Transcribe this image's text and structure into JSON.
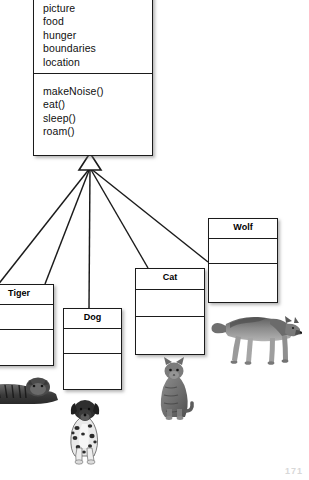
{
  "diagram": {
    "kind": "uml-class-inheritance",
    "superclass": {
      "name": "Animal",
      "attributes": [
        "picture",
        "food",
        "hunger",
        "boundaries",
        "location"
      ],
      "methods": [
        "makeNoise()",
        "eat()",
        "sleep()",
        "roam()"
      ]
    },
    "subclasses": [
      {
        "id": "hidden",
        "label": "",
        "visible_label": false
      },
      {
        "id": "tiger",
        "label": "Tiger",
        "visible_label": true
      },
      {
        "id": "dog",
        "label": "Dog",
        "visible_label": true
      },
      {
        "id": "cat",
        "label": "Cat",
        "visible_label": true
      },
      {
        "id": "wolf",
        "label": "Wolf",
        "visible_label": true
      }
    ],
    "photos": [
      {
        "id": "tiger-photo",
        "subject": "tiger-lying-down"
      },
      {
        "id": "dog-photo",
        "subject": "dalmatian-sitting"
      },
      {
        "id": "cat-photo",
        "subject": "tabby-cat-sitting"
      },
      {
        "id": "wolf-photo",
        "subject": "wolf-walking"
      }
    ],
    "page_artifact": "171",
    "colors": {
      "line": "#1b1b1b",
      "box_fill": "#ffffff",
      "page": "#ffffff",
      "shadow": "#787878"
    }
  }
}
